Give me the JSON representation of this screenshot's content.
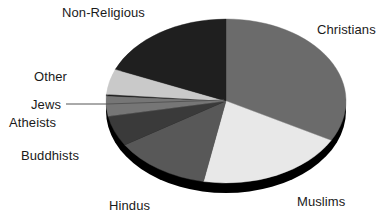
{
  "chart_data": {
    "type": "pie",
    "title": "",
    "subtitle": "",
    "xlabel": "",
    "ylabel": "",
    "legend_position": "none",
    "grid": false,
    "style": "3d-pie-exploded-none",
    "start_angle_deg": 0,
    "direction": "clockwise",
    "labels_placement": "outside-with-leader-lines",
    "categories": [
      "Christians",
      "Muslims",
      "Hindus",
      "Buddhists",
      "Atheists",
      "Jews",
      "Other",
      "Non-Religious"
    ],
    "values": [
      33,
      20,
      13,
      6,
      4,
      0.3,
      5,
      18.7
    ],
    "slices": [
      {
        "label": "Christians",
        "value": 33,
        "start_deg": 0,
        "end_deg": 118.8,
        "color": "#6b6b6b"
      },
      {
        "label": "Muslims",
        "value": 20,
        "start_deg": 118.8,
        "end_deg": 190.8,
        "color": "#e8e8e8"
      },
      {
        "label": "Hindus",
        "value": 13,
        "start_deg": 190.8,
        "end_deg": 237.6,
        "color": "#585858"
      },
      {
        "label": "Buddhists",
        "value": 6,
        "start_deg": 237.6,
        "end_deg": 259.2,
        "color": "#3a3a3a"
      },
      {
        "label": "Atheists",
        "value": 4,
        "start_deg": 259.2,
        "end_deg": 273.6,
        "color": "#767676"
      },
      {
        "label": "Jews",
        "value": 0.3,
        "start_deg": 273.6,
        "end_deg": 274.7,
        "color": "#1c1c1c"
      },
      {
        "label": "Other",
        "value": 5,
        "start_deg": 274.7,
        "end_deg": 292.7,
        "color": "#c9c9c9"
      },
      {
        "label": "Non-Religious",
        "value": 18.7,
        "start_deg": 292.7,
        "end_deg": 360,
        "color": "#1f1f1f"
      }
    ]
  },
  "labels": {
    "non_religious": "Non-Religious",
    "christians": "Christians",
    "other": "Other",
    "jews": "Jews",
    "atheists": "Atheists",
    "buddhists": "Buddhists",
    "hindus": "Hindus",
    "muslims": "Muslims"
  },
  "colors": {
    "background": "#ffffff",
    "text": "#1a1a1a",
    "pie_base_shadow": "#000000",
    "leader_line": "#555555",
    "christians": "#6b6b6b",
    "muslims": "#e8e8e8",
    "hindus": "#585858",
    "buddhists": "#3a3a3a",
    "atheists": "#767676",
    "jews": "#1c1c1c",
    "other": "#c9c9c9",
    "non_religious": "#1f1f1f"
  }
}
